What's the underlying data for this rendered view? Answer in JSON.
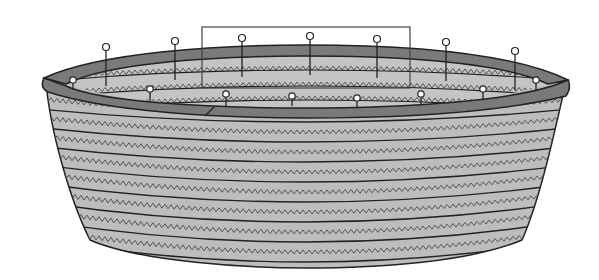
{
  "figure": {
    "colors": {
      "background": "#ffffff",
      "body_fill": "#bdbdbd",
      "rim_fill": "#7a7a7a",
      "inner_fill": "#c4c4c4",
      "stroke": "#222222",
      "zigzag": "#555555",
      "pin_head": "#ffffff"
    },
    "highlight_box": {
      "x": 202,
      "y": 27,
      "width": 208,
      "height": 61
    },
    "outer_pins": [
      {
        "x": 106,
        "top": 47,
        "bottom": 86
      },
      {
        "x": 175,
        "top": 41,
        "bottom": 80
      },
      {
        "x": 242,
        "top": 38,
        "bottom": 77
      },
      {
        "x": 310,
        "top": 36,
        "bottom": 75
      },
      {
        "x": 377,
        "top": 39,
        "bottom": 78
      },
      {
        "x": 446,
        "top": 42,
        "bottom": 81
      },
      {
        "x": 515,
        "top": 51,
        "bottom": 90
      }
    ],
    "inner_pins": [
      {
        "x": 73,
        "top": 80,
        "bottom": 90
      },
      {
        "x": 150,
        "top": 89,
        "bottom": 101
      },
      {
        "x": 226,
        "top": 94,
        "bottom": 106
      },
      {
        "x": 292,
        "top": 96,
        "bottom": 106
      },
      {
        "x": 357,
        "top": 98,
        "bottom": 107
      },
      {
        "x": 421,
        "top": 94,
        "bottom": 104
      },
      {
        "x": 483,
        "top": 89,
        "bottom": 99
      },
      {
        "x": 536,
        "top": 80,
        "bottom": 91
      }
    ],
    "body_bands": 8
  }
}
